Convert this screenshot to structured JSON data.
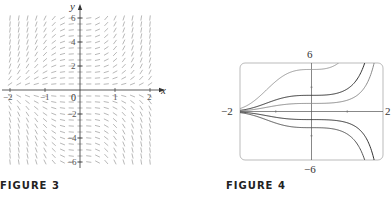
{
  "figure3": {
    "caption": "FIGURE 3",
    "x_axis_label": "x",
    "y_axis_label": "y",
    "x_ticks": [
      "-2",
      "-1",
      "0",
      "1",
      "2"
    ],
    "y_ticks": [
      "6",
      "4",
      "2",
      "-2",
      "-4",
      "-6"
    ]
  },
  "figure4": {
    "caption": "FIGURE 4",
    "top_label": "6",
    "bottom_label": "-6",
    "left_label": "-2",
    "right_label": "2"
  },
  "chart_data": [
    {
      "type": "scatter",
      "title": "Direction field",
      "xlabel": "x",
      "ylabel": "y",
      "xlim": [
        -2,
        2
      ],
      "ylim": [
        -6,
        6
      ],
      "x_ticks": [
        -2,
        -1,
        0,
        1,
        2
      ],
      "y_ticks": [
        -6,
        -4,
        -2,
        2,
        4,
        6
      ],
      "grid": false,
      "description": "Slope field: horizontal segments along x=0 and y=0, slopes positive for y>0 and negative for y<0, steepening as |x| and |y| grow (consistent with y' = x^2 y)."
    },
    {
      "type": "line",
      "title": "Solution curves",
      "xlim": [
        -2,
        2
      ],
      "ylim": [
        -6,
        6
      ],
      "axis_labels": {
        "left": "-2",
        "right": "2",
        "top": "6",
        "bottom": "-6"
      },
      "series": [
        {
          "name": "curve 1",
          "y_at_0": 5.2
        },
        {
          "name": "curve 2",
          "y_at_0": 2.0
        },
        {
          "name": "curve 3",
          "y_at_0": 1.0
        },
        {
          "name": "curve 4",
          "y_at_0": -1.0
        },
        {
          "name": "curve 5",
          "y_at_0": -2.0
        }
      ],
      "grid": false
    }
  ]
}
